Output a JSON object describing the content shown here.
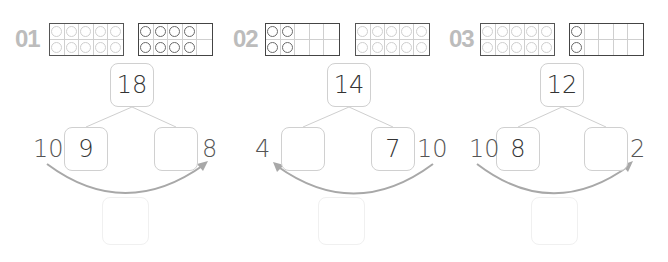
{
  "problems": [
    {
      "number": "01",
      "frames": [
        {
          "filled": 10,
          "style": "light"
        },
        {
          "filled": 8,
          "style": "dark"
        }
      ],
      "whole": "18",
      "left_part": "9",
      "right_part": "",
      "left_side_label": "10",
      "right_side_label": "8",
      "arrow_direction": "left-to-right",
      "answer": ""
    },
    {
      "number": "02",
      "frames": [
        {
          "filled": 4,
          "style": "dark"
        },
        {
          "filled": 10,
          "style": "light"
        }
      ],
      "whole": "14",
      "left_part": "",
      "right_part": "7",
      "left_side_label": "4",
      "right_side_label": "10",
      "arrow_direction": "right-to-left",
      "answer": ""
    },
    {
      "number": "03",
      "frames": [
        {
          "filled": 10,
          "style": "light"
        },
        {
          "filled": 2,
          "style": "dark"
        }
      ],
      "whole": "12",
      "left_part": "8",
      "right_part": "",
      "left_side_label": "10",
      "right_side_label": "2",
      "arrow_direction": "left-to-right",
      "answer": ""
    }
  ],
  "colors": {
    "label": "#bcbcbc",
    "frame_border": "#444444",
    "light_dot": "#cfcfcf",
    "dark_dot": "#6a6a6a",
    "box_border": "#d0d0d0",
    "arrow": "#a8a8a8"
  }
}
